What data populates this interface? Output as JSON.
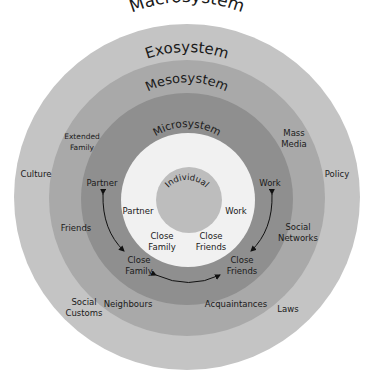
{
  "diagram": {
    "rings": [
      {
        "name": "Macrosystem",
        "color": "#c4c4c4",
        "radius": 173
      },
      {
        "name": "Exosystem",
        "color": "#a9a9a9",
        "radius": 137
      },
      {
        "name": "Mesosystem",
        "color": "#8f8f8f",
        "radius": 104
      },
      {
        "name": "Microsystem",
        "color": "#f2f2f2",
        "radius": 66
      },
      {
        "name": "Individual",
        "color": "#bdbdbd",
        "radius": 33
      }
    ],
    "labels": {
      "macrosystem": "Macrosystem",
      "exosystem": "Exosystem",
      "mesosystem": "Mesosystem",
      "microsystem": "Microsystem",
      "individual": "Individual"
    },
    "macro_items": {
      "culture": "Culture",
      "policy": "Policy",
      "social_customs_1": "Social",
      "social_customs_2": "Customs",
      "laws": "Laws"
    },
    "exo_items": {
      "extended_family_1": "Extended",
      "extended_family_2": "Family",
      "mass_media_1": "Mass",
      "mass_media_2": "Media",
      "friends": "Friends",
      "social_networks_1": "Social",
      "social_networks_2": "Networks",
      "neighbours": "Neighbours",
      "acquaintances": "Acquaintances"
    },
    "meso_items": {
      "partner": "Partner",
      "work": "Work",
      "close_family_1": "Close",
      "close_family_2": "Family",
      "close_friends_1": "Close",
      "close_friends_2": "Friends"
    },
    "micro_items": {
      "partner": "Partner",
      "work": "Work",
      "close_family_1": "Close",
      "close_family_2": "Family",
      "close_friends_1": "Close",
      "close_friends_2": "Friends"
    }
  }
}
